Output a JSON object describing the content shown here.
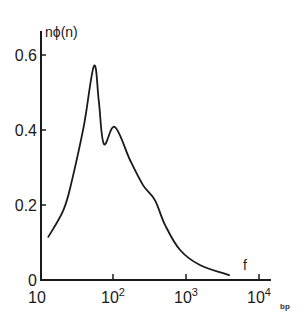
{
  "chart_data": {
    "type": "line",
    "title": "",
    "xlabel": "f",
    "ylabel": "nϕ(n)",
    "xscale": "log",
    "xlim": [
      10,
      10000
    ],
    "ylim": [
      0,
      0.65
    ],
    "grid": false,
    "legend": null,
    "x_ticks": [
      10,
      100,
      1000,
      10000
    ],
    "x_tick_labels": [
      {
        "base": "10",
        "exp": ""
      },
      {
        "base": "10",
        "exp": "2"
      },
      {
        "base": "10",
        "exp": "3"
      },
      {
        "base": "10",
        "exp": "4"
      }
    ],
    "y_ticks": [
      0,
      0.2,
      0.4,
      0.6
    ],
    "y_tick_labels": [
      "0",
      "0.2",
      "0.4",
      "0.6"
    ],
    "series": [
      {
        "name": "nϕ(n)",
        "x": [
          13,
          21,
          27.5,
          40,
          55,
          64,
          75,
          106,
          171,
          258,
          375,
          516,
          830,
          1550,
          3900
        ],
        "values": [
          0.115,
          0.187,
          0.267,
          0.413,
          0.571,
          0.475,
          0.363,
          0.408,
          0.32,
          0.253,
          0.213,
          0.147,
          0.08,
          0.04,
          0.013
        ]
      }
    ],
    "annotations": [
      {
        "text": "f",
        "position": "near x-axis end, above axis"
      },
      {
        "text": "bp",
        "position": "bottom-right corner mark"
      }
    ]
  },
  "labels": {
    "y_axis_title": "nϕ(n)",
    "x_axis_title": "f",
    "corner_mark": "bp",
    "y_ticks": [
      "0",
      "0.2",
      "0.4",
      "0.6"
    ],
    "x_ticks": [
      {
        "base": "10",
        "exp": ""
      },
      {
        "base": "10",
        "exp": "2"
      },
      {
        "base": "10",
        "exp": "3"
      },
      {
        "base": "10",
        "exp": "4"
      }
    ]
  }
}
